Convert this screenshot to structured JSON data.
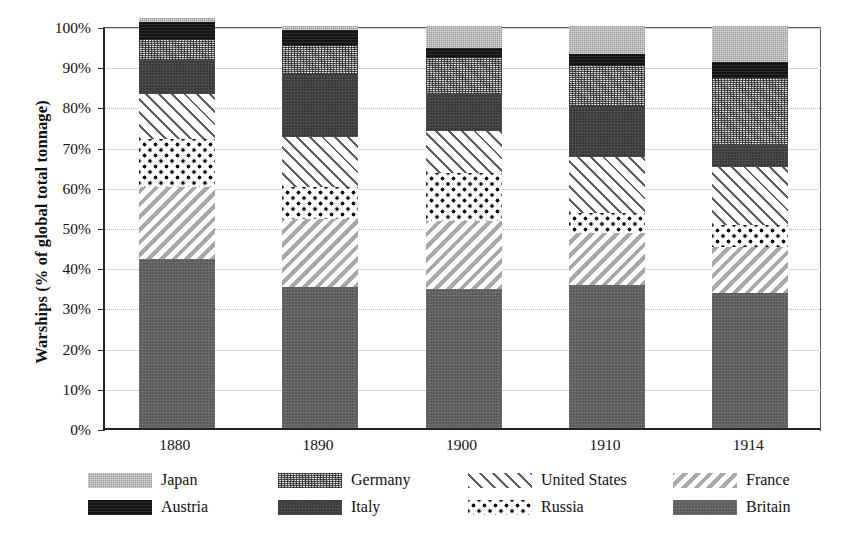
{
  "chart_data": {
    "type": "bar",
    "subtype": "stacked-bar-100-percent",
    "title": "",
    "xlabel": "",
    "ylabel": "Warships (% of global total tonnage)",
    "ylim": [
      0,
      100
    ],
    "ytick_labels": [
      "0%",
      "10%",
      "20%",
      "30%",
      "40%",
      "50%",
      "60%",
      "70%",
      "80%",
      "90%",
      "100%"
    ],
    "ytick_values": [
      0,
      10,
      20,
      30,
      40,
      50,
      60,
      70,
      80,
      90,
      100
    ],
    "grid": true,
    "legend_position": "bottom",
    "categories": [
      "1880",
      "1890",
      "1900",
      "1910",
      "1914"
    ],
    "stack_order_bottom_to_top": [
      "Britain",
      "France",
      "Russia",
      "United States",
      "Italy",
      "Germany",
      "Austria",
      "Japan"
    ],
    "series": [
      {
        "name": "Britain",
        "pattern": "solid-dark-gray",
        "color": "#5a5a5a",
        "values": [
          42.0,
          35.0,
          34.5,
          35.5,
          33.5
        ]
      },
      {
        "name": "France",
        "pattern": "backslash-hatch",
        "color": "#a8a8a8",
        "values": [
          18.0,
          17.0,
          17.0,
          13.0,
          11.5
        ]
      },
      {
        "name": "Russia",
        "pattern": "large-dots",
        "color": "#111111",
        "values": [
          12.0,
          8.0,
          12.0,
          5.0,
          5.5
        ]
      },
      {
        "name": "United States",
        "pattern": "forward-slash-hatch",
        "color": "#5f5f5f",
        "values": [
          11.0,
          12.5,
          10.5,
          14.0,
          14.5
        ]
      },
      {
        "name": "Italy",
        "pattern": "solid-near-black",
        "color": "#3a3a3a",
        "values": [
          8.5,
          15.5,
          9.0,
          12.5,
          5.5
        ]
      },
      {
        "name": "Germany",
        "pattern": "fine-speckle",
        "color": "#f2f2f2",
        "values": [
          5.0,
          7.0,
          9.0,
          10.0,
          16.5
        ]
      },
      {
        "name": "Austria",
        "pattern": "solid-black",
        "color": "#141414",
        "values": [
          4.5,
          4.0,
          2.5,
          3.0,
          4.0
        ]
      },
      {
        "name": "Japan",
        "pattern": "light-gray-speckle",
        "color": "#9d9d9d",
        "values": [
          1.0,
          1.0,
          5.5,
          7.0,
          9.0
        ]
      }
    ],
    "legend_entries": [
      {
        "name": "Japan",
        "row": 0,
        "col": 0
      },
      {
        "name": "Germany",
        "row": 0,
        "col": 1
      },
      {
        "name": "United States",
        "row": 0,
        "col": 2
      },
      {
        "name": "France",
        "row": 0,
        "col": 3
      },
      {
        "name": "Austria",
        "row": 1,
        "col": 0
      },
      {
        "name": "Italy",
        "row": 1,
        "col": 1
      },
      {
        "name": "Russia",
        "row": 1,
        "col": 2
      },
      {
        "name": "Britain",
        "row": 1,
        "col": 3
      }
    ]
  }
}
